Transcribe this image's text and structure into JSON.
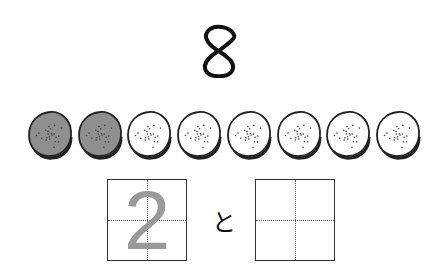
{
  "title": {
    "number": "8"
  },
  "cookies": {
    "total": 8,
    "filled_count": 2,
    "items": [
      {
        "state": "filled",
        "color": "#8f8f8f"
      },
      {
        "state": "filled",
        "color": "#8f8f8f"
      },
      {
        "state": "empty",
        "color": "#ffffff"
      },
      {
        "state": "empty",
        "color": "#ffffff"
      },
      {
        "state": "empty",
        "color": "#ffffff"
      },
      {
        "state": "empty",
        "color": "#ffffff"
      },
      {
        "state": "empty",
        "color": "#ffffff"
      },
      {
        "state": "empty",
        "color": "#ffffff"
      }
    ]
  },
  "answer": {
    "left_box": {
      "value": "2",
      "color": "#9a9a9a"
    },
    "connector": "と",
    "right_box": {
      "value": ""
    }
  }
}
